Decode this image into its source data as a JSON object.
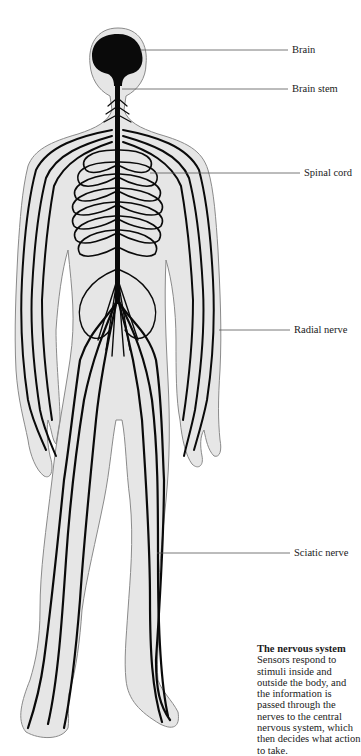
{
  "diagram": {
    "title": "The nervous system",
    "colors": {
      "body_fill": "#e6e6e6",
      "body_outline": "#8a8a8a",
      "nerve": "#0a0a0a",
      "leader_line": "#555555",
      "text": "#1a1a1a"
    },
    "labels": [
      {
        "id": "brain",
        "text": "Brain",
        "y": 50
      },
      {
        "id": "brain-stem",
        "text": "Brain stem",
        "y": 89
      },
      {
        "id": "spinal-cord",
        "text": "Spinal cord",
        "y": 173
      },
      {
        "id": "radial-nerve",
        "text": "Radial nerve",
        "y": 330
      },
      {
        "id": "sciatic-nerve",
        "text": "Sciatic nerve",
        "y": 553
      }
    ],
    "caption": {
      "title": "The nervous system",
      "body": "Sensors respond to stimuli inside and outside the body, and the information is passed through the nerves to the central nervous system, which then decides what action to take."
    }
  }
}
